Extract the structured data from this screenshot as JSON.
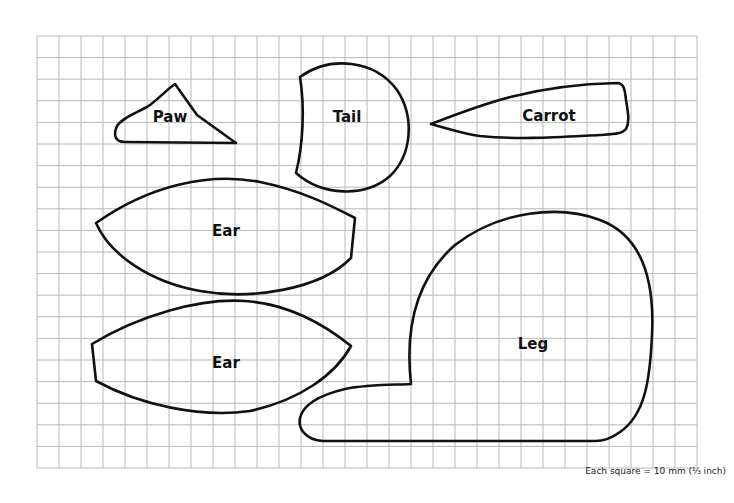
{
  "pattern": {
    "grid": {
      "left": 37,
      "top": 36,
      "right": 697,
      "bottom": 468,
      "cell_px": 22,
      "line_color": "#b8b8b8"
    },
    "pieces": [
      {
        "id": "paw",
        "label": "Paw",
        "label_pos": [
          170,
          117
        ],
        "path": "M 175 84 L 197 115 L 236 143 L 125 142 C 115 142 113 135 117 126 C 122 118 136 113 147 107 C 158 100 166 90 175 84 Z"
      },
      {
        "id": "tail",
        "label": "Tail",
        "label_pos": [
          347,
          117
        ],
        "path": "M 300 77 C 330 55 375 60 397 90 C 415 117 412 155 390 176 C 365 198 322 196 296 173 C 303 145 305 108 300 77 Z"
      },
      {
        "id": "carrot",
        "label": "Carrot",
        "label_pos": [
          549,
          116
        ],
        "path": "M 431 124 C 480 105 530 85 617 83 C 624 83 625 90 626 100 C 628 112 630 122 626 129 C 622 134 615 134 600 135 C 560 137 520 140 480 136 C 465 134 445 128 431 124 Z"
      },
      {
        "id": "ear-top",
        "label": "Ear",
        "label_pos": [
          226,
          231
        ],
        "path": "M 96 223 C 150 185 210 172 260 182 C 300 190 330 205 355 218 L 351 258 C 320 290 250 300 200 291 C 150 282 110 255 96 223 Z"
      },
      {
        "id": "ear-bottom",
        "label": "Ear",
        "label_pos": [
          226,
          363
        ],
        "path": "M 92 344 C 140 315 200 298 245 301 C 290 304 325 325 351 346 C 335 375 300 400 250 411 C 200 418 140 405 96 381 Z"
      },
      {
        "id": "leg",
        "label": "Leg",
        "label_pos": [
          533,
          344
        ],
        "path": "M 411 384 C 405 330 415 280 455 245 C 500 210 560 205 600 220 C 640 235 655 275 652 335 C 650 380 645 415 620 432 C 612 438 605 441 595 441 L 323 441 C 305 440 298 428 300 418 C 303 405 320 395 345 389 C 370 384 395 385 411 384 Z"
      }
    ]
  },
  "caption": "Each square = 10 mm (¹⁄₃ inch)"
}
